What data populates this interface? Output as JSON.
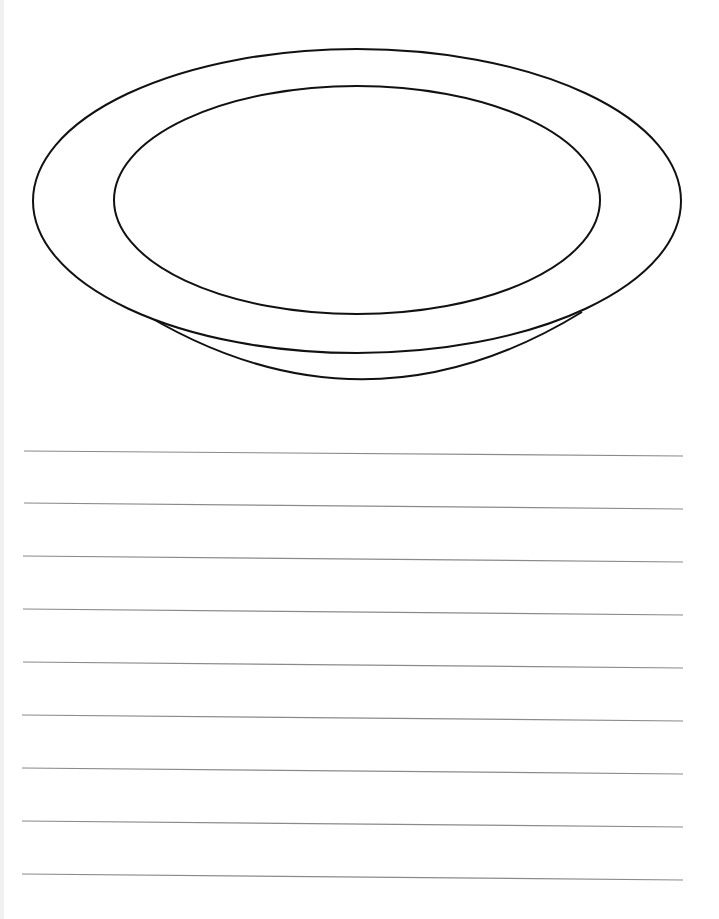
{
  "worksheet": {
    "illustration": "plate-outline",
    "colors": {
      "outline": "#111111",
      "ruled_line": "#8a8a8a",
      "background": "#ffffff"
    },
    "plate": {
      "rim": {
        "cx": 357,
        "cy": 201,
        "rx": 324,
        "ry": 152
      },
      "well": {
        "cx": 357,
        "cy": 200,
        "rx": 243,
        "ry": 114
      },
      "base_arc": {
        "start": [
          130,
          305
        ],
        "control": [
          357,
          450
        ],
        "end": [
          582,
          312
        ]
      }
    },
    "ruled_lines": [
      {
        "x1": 24,
        "y1": 451,
        "x2": 683,
        "y2": 456
      },
      {
        "x1": 24,
        "y1": 503,
        "x2": 683,
        "y2": 509
      },
      {
        "x1": 23,
        "y1": 556,
        "x2": 683,
        "y2": 562
      },
      {
        "x1": 23,
        "y1": 609,
        "x2": 683,
        "y2": 615
      },
      {
        "x1": 23,
        "y1": 662,
        "x2": 683,
        "y2": 668
      },
      {
        "x1": 22,
        "y1": 715,
        "x2": 683,
        "y2": 721
      },
      {
        "x1": 22,
        "y1": 768,
        "x2": 683,
        "y2": 774
      },
      {
        "x1": 22,
        "y1": 821,
        "x2": 683,
        "y2": 827
      },
      {
        "x1": 22,
        "y1": 874,
        "x2": 683,
        "y2": 880
      }
    ]
  }
}
